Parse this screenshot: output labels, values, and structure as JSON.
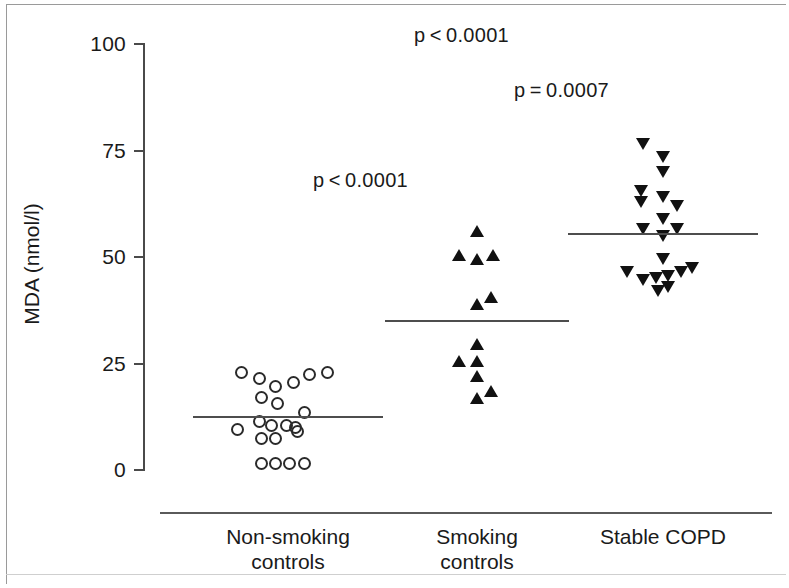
{
  "chart_data": {
    "type": "scatter",
    "title": "",
    "xlabel": "",
    "ylabel": "MDA (nmol/l)",
    "ylim": [
      0,
      100
    ],
    "yticks": [
      0,
      25,
      50,
      75,
      100
    ],
    "ytick_labels": [
      "0",
      "25",
      "50",
      "75",
      "100"
    ],
    "grid": false,
    "legend": "none",
    "categories": [
      "Non-smoking controls",
      "Smoking controls",
      "Stable COPD"
    ],
    "category_lines": [
      "Non-smoking\ncontrols",
      "Smoking\ncontrols",
      "Stable COPD"
    ],
    "groups": [
      {
        "name": "Non-smoking controls",
        "marker": "open-circle",
        "mean": 12.5,
        "n": 20,
        "points": [
          {
            "x": -0.26,
            "y": 23.0
          },
          {
            "x": -0.16,
            "y": 21.5
          },
          {
            "x": -0.07,
            "y": 19.5
          },
          {
            "x": 0.03,
            "y": 20.5
          },
          {
            "x": 0.12,
            "y": 22.5
          },
          {
            "x": 0.22,
            "y": 23.0
          },
          {
            "x": -0.15,
            "y": 17.0
          },
          {
            "x": -0.06,
            "y": 15.5
          },
          {
            "x": 0.09,
            "y": 13.5
          },
          {
            "x": -0.16,
            "y": 11.5
          },
          {
            "x": -0.09,
            "y": 10.5
          },
          {
            "x": -0.01,
            "y": 10.5
          },
          {
            "x": 0.04,
            "y": 10.0
          },
          {
            "x": 0.05,
            "y": 9.0
          },
          {
            "x": -0.28,
            "y": 9.5
          },
          {
            "x": -0.15,
            "y": 7.5
          },
          {
            "x": -0.07,
            "y": 7.5
          },
          {
            "x": -0.15,
            "y": 1.5
          },
          {
            "x": -0.07,
            "y": 1.5
          },
          {
            "x": 0.01,
            "y": 1.5
          },
          {
            "x": 0.09,
            "y": 1.5
          }
        ]
      },
      {
        "name": "Smoking controls",
        "marker": "filled-triangle-up",
        "mean": 35.0,
        "n": 12,
        "points": [
          {
            "x": 0.0,
            "y": 56.0
          },
          {
            "x": -0.1,
            "y": 50.5
          },
          {
            "x": 0.0,
            "y": 49.5
          },
          {
            "x": 0.09,
            "y": 50.5
          },
          {
            "x": 0.0,
            "y": 39.0
          },
          {
            "x": 0.08,
            "y": 40.5
          },
          {
            "x": 0.0,
            "y": 29.5
          },
          {
            "x": -0.1,
            "y": 25.5
          },
          {
            "x": 0.0,
            "y": 25.5
          },
          {
            "x": 0.0,
            "y": 22.0
          },
          {
            "x": 0.08,
            "y": 18.5
          },
          {
            "x": 0.0,
            "y": 17.0
          }
        ]
      },
      {
        "name": "Stable COPD",
        "marker": "filled-triangle-down",
        "mean": 55.5,
        "n": 20,
        "points": [
          {
            "x": -0.11,
            "y": 76.5
          },
          {
            "x": 0.0,
            "y": 73.5
          },
          {
            "x": 0.0,
            "y": 70.0
          },
          {
            "x": -0.12,
            "y": 65.5
          },
          {
            "x": -0.12,
            "y": 63.0
          },
          {
            "x": 0.0,
            "y": 64.0
          },
          {
            "x": 0.08,
            "y": 62.0
          },
          {
            "x": 0.0,
            "y": 59.0
          },
          {
            "x": -0.11,
            "y": 56.5
          },
          {
            "x": 0.08,
            "y": 56.5
          },
          {
            "x": 0.0,
            "y": 55.0
          },
          {
            "x": 0.0,
            "y": 49.5
          },
          {
            "x": -0.2,
            "y": 46.5
          },
          {
            "x": -0.11,
            "y": 44.5
          },
          {
            "x": -0.04,
            "y": 45.0
          },
          {
            "x": 0.03,
            "y": 45.5
          },
          {
            "x": 0.03,
            "y": 43.0
          },
          {
            "x": 0.1,
            "y": 46.5
          },
          {
            "x": 0.16,
            "y": 47.5
          },
          {
            "x": -0.03,
            "y": 42.0
          }
        ]
      }
    ],
    "annotations": [
      {
        "text": "p < 0.0001",
        "x_px": 414,
        "y_px": 24
      },
      {
        "text": "p = 0.0007",
        "x_px": 514,
        "y_px": 79
      },
      {
        "text": "p < 0.0001",
        "x_px": 313,
        "y_px": 169
      }
    ]
  },
  "axis": {
    "y_title": "MDA (nmol/l)",
    "ticks": [
      "100",
      "75",
      "50",
      "25",
      "0"
    ]
  },
  "x_categories": [
    {
      "line1": "Non-smoking",
      "line2": "controls"
    },
    {
      "line1": "Smoking",
      "line2": "controls"
    },
    {
      "line1": "Stable COPD",
      "line2": ""
    }
  ],
  "pvalues": [
    {
      "label": "p < 0.0001"
    },
    {
      "label": "p = 0.0007"
    },
    {
      "label": "p < 0.0001"
    }
  ],
  "colors": {
    "marker": "#111111",
    "axis": "#4a4a4a",
    "mean_line": "#4d4d4d",
    "text": "#1a1a1a",
    "background": "#ffffff"
  }
}
